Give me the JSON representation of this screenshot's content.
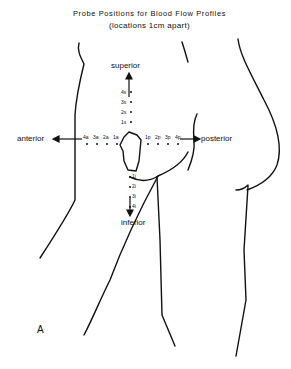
{
  "title": {
    "line1": "Probe Positions for Blood Flow Profiles",
    "line2": "(locations 1cm apart)"
  },
  "directions": {
    "superior": "superior",
    "inferior": "inferior",
    "anterior": "anterior",
    "posterior": "posterior"
  },
  "probe_points": {
    "superior": [
      "4s",
      "3s",
      "2s",
      "1s"
    ],
    "anterior": [
      "4a",
      "3a",
      "2a",
      "1a"
    ],
    "posterior": [
      "1p",
      "2p",
      "3p",
      "4p"
    ],
    "inferior": [
      "1i",
      "2i",
      "3i",
      "4i"
    ]
  },
  "figure_label": "A",
  "colors": {
    "ink": "#111111",
    "background": "#ffffff"
  }
}
